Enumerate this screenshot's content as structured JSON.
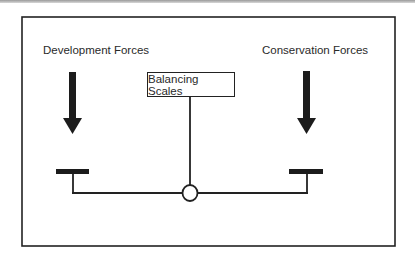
{
  "diagram": {
    "left_label": "Development Forces",
    "right_label": "Conservation Forces",
    "center_label": "Balancing Scales",
    "colors": {
      "line": "#222222",
      "background": "#ffffff",
      "text": "#2a2a2a"
    }
  }
}
